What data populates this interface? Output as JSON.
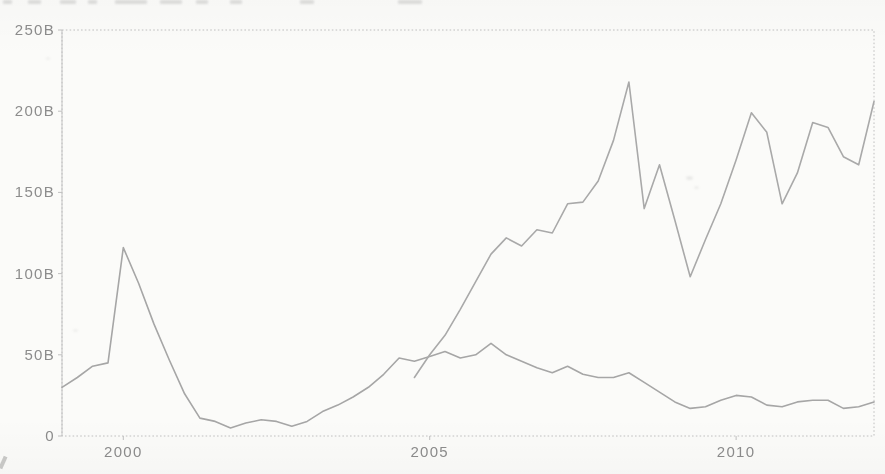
{
  "figure": {
    "background_color": "#fbfbf9",
    "border_color": "#c0c0c0",
    "tick_label_color": "#8c8c8c",
    "line_colors": [
      "#a6a6a6",
      "#a9a9a9"
    ]
  },
  "chart_data": {
    "type": "line",
    "title": "",
    "xlabel": "",
    "ylabel": "",
    "grid": false,
    "legend": "none",
    "xlim": [
      1999.0,
      2012.25
    ],
    "ylim": [
      0,
      250
    ],
    "x_ticks": [
      2000,
      2005,
      2010
    ],
    "x_tick_labels": [
      "2000",
      "2005",
      "2010"
    ],
    "y_ticks": [
      0,
      50,
      100,
      150,
      200,
      250
    ],
    "y_tick_labels": [
      "0",
      "50B",
      "100B",
      "150B",
      "200B",
      "250B"
    ],
    "x_unit": "year (quarterly points)",
    "series": [
      {
        "name": "series-1",
        "start": 1999.0,
        "step": 0.25,
        "values": [
          30,
          36,
          43,
          45,
          116,
          94,
          69,
          47,
          26,
          11,
          9,
          5,
          8,
          10,
          9,
          6,
          9,
          15,
          19,
          24,
          30,
          38,
          48,
          46,
          49,
          52,
          48,
          50,
          57,
          50,
          46,
          42,
          39,
          43,
          38,
          36,
          36,
          39,
          33,
          27,
          21,
          17,
          18,
          22,
          25,
          24,
          19,
          18,
          21,
          22,
          22,
          17,
          18,
          21
        ]
      },
      {
        "name": "series-2",
        "start": 2004.75,
        "step": 0.25,
        "values": [
          36,
          50,
          62,
          78,
          95,
          112,
          122,
          117,
          127,
          125,
          143,
          144,
          157,
          182,
          218,
          140,
          167,
          133,
          98,
          121,
          143,
          170,
          199,
          187,
          143,
          162,
          193,
          190,
          172,
          167,
          206
        ]
      }
    ]
  }
}
